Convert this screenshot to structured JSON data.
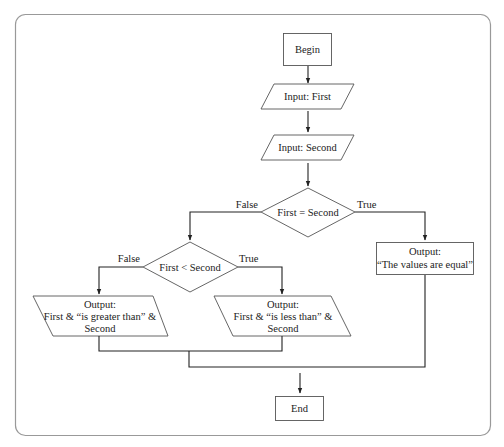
{
  "diagram": {
    "type": "flowchart",
    "nodes": {
      "begin": {
        "shape": "terminal",
        "text": "Begin"
      },
      "input_first": {
        "shape": "io",
        "text": "Input: First"
      },
      "input_second": {
        "shape": "io",
        "text": "Input: Second"
      },
      "decision_equal": {
        "shape": "decision",
        "text": "First = Second"
      },
      "decision_less": {
        "shape": "decision",
        "text": "First < Second"
      },
      "output_greater": {
        "shape": "io",
        "lines": [
          "Output:",
          "First & “is greater than” &",
          "Second"
        ]
      },
      "output_less": {
        "shape": "io",
        "lines": [
          "Output:",
          "First & “is less than” &",
          "Second"
        ]
      },
      "output_equal": {
        "shape": "process",
        "lines": [
          "Output:",
          "“The values are equal”"
        ]
      },
      "end": {
        "shape": "terminal",
        "text": "End"
      }
    },
    "edge_labels": {
      "equal_false": "False",
      "equal_true": "True",
      "less_false": "False",
      "less_true": "True"
    },
    "edges": [
      [
        "begin",
        "input_first"
      ],
      [
        "input_first",
        "input_second"
      ],
      [
        "input_second",
        "decision_equal"
      ],
      [
        "decision_equal",
        "decision_less",
        "False"
      ],
      [
        "decision_equal",
        "output_equal",
        "True"
      ],
      [
        "decision_less",
        "output_greater",
        "False"
      ],
      [
        "decision_less",
        "output_less",
        "True"
      ],
      [
        "output_greater",
        "end"
      ],
      [
        "output_less",
        "end"
      ],
      [
        "output_equal",
        "end"
      ]
    ]
  }
}
